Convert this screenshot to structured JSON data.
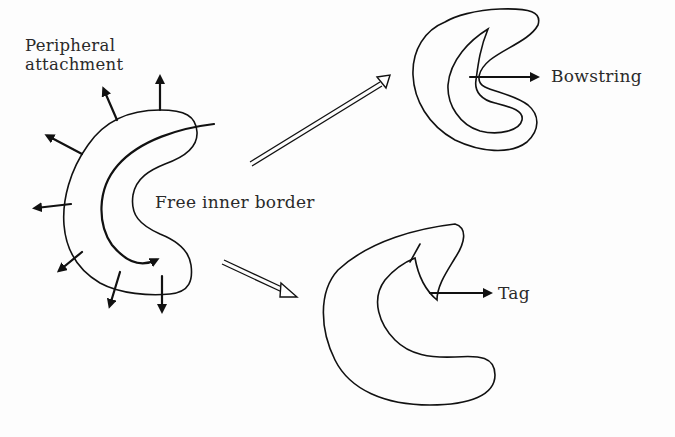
{
  "figure": {
    "labels": {
      "peripheral_line1": "Peripheral",
      "peripheral_line2": "attachment",
      "free_inner_border": "Free inner border",
      "bowstring": "Bowstring",
      "tag": "Tag"
    },
    "panels": [
      {
        "id": "source",
        "description": "Crescent with peripheral attachment arrows and free inner border arrow"
      },
      {
        "id": "outcome-bowstring",
        "description": "Crescent with bowstring deformity"
      },
      {
        "id": "outcome-tag",
        "description": "Crescent with tag deformity"
      }
    ],
    "arrows": [
      {
        "from": "source",
        "to": "outcome-bowstring",
        "style": "hollow-double-line"
      },
      {
        "from": "source",
        "to": "outcome-tag",
        "style": "hollow-double-line"
      }
    ],
    "colors": {
      "ink": "#111111",
      "background": "#fdfdfd"
    }
  }
}
